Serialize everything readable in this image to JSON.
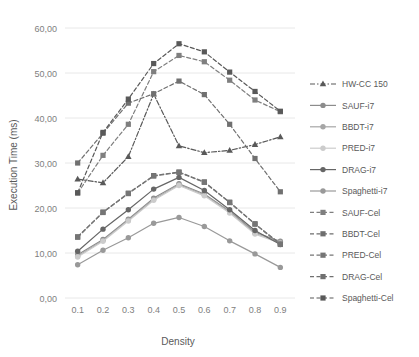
{
  "chart_data": {
    "type": "line",
    "title": "",
    "xlabel": "Density",
    "ylabel": "Execution Time (ms)",
    "x": [
      0.1,
      0.2,
      0.3,
      0.4,
      0.5,
      0.6,
      0.7,
      0.8,
      0.9
    ],
    "xtick_labels": [
      "0.1",
      "0.2",
      "0.3",
      "0.4",
      "0.5",
      "0.6",
      "0.7",
      "0.8",
      "0.9"
    ],
    "ytick_labels": [
      "0,00",
      "10,00",
      "20,00",
      "30,00",
      "40,00",
      "50,00",
      "60,00"
    ],
    "ytick_values": [
      0,
      10,
      20,
      30,
      40,
      50,
      60
    ],
    "ylim": [
      0,
      60
    ],
    "grid": "horizontal",
    "legend_position": "right",
    "series": [
      {
        "name": "HW-CC 150",
        "marker": "triangle",
        "dash": "dashdot",
        "color": "#595959",
        "values": [
          26.4,
          25.6,
          31.4,
          45.3,
          33.8,
          32.3,
          32.8,
          34.1,
          35.8
        ]
      },
      {
        "name": "SAUF-i7",
        "marker": "circle",
        "dash": "solid",
        "color": "#8c8c8c",
        "values": [
          9.6,
          13.0,
          17.5,
          22.2,
          25.4,
          23.1,
          19.3,
          14.6,
          12.6
        ]
      },
      {
        "name": "BBDT-i7",
        "marker": "circle",
        "dash": "solid",
        "color": "#a6a6a6",
        "values": [
          9.3,
          12.8,
          17.3,
          21.9,
          25.2,
          22.9,
          19.1,
          14.4,
          12.4
        ]
      },
      {
        "name": "PRED-i7",
        "marker": "circle",
        "dash": "solid",
        "color": "#cccccc",
        "values": [
          9.1,
          12.6,
          17.1,
          21.7,
          25.0,
          22.7,
          18.9,
          14.2,
          12.2
        ]
      },
      {
        "name": "DRAG-i7",
        "marker": "circle",
        "dash": "solid",
        "color": "#666666",
        "values": [
          10.4,
          15.3,
          19.6,
          24.2,
          26.8,
          23.9,
          19.6,
          15.0,
          11.9
        ]
      },
      {
        "name": "Spaghetti-i7",
        "marker": "circle",
        "dash": "solid",
        "color": "#999999",
        "values": [
          7.4,
          10.6,
          13.4,
          16.6,
          17.9,
          15.9,
          12.7,
          9.8,
          6.8
        ]
      },
      {
        "name": "SAUF-Cel",
        "marker": "square",
        "dash": "dashed",
        "color": "#7f7f7f",
        "values": [
          23.3,
          31.7,
          38.6,
          50.3,
          53.9,
          52.5,
          48.4,
          44.0,
          41.4
        ]
      },
      {
        "name": "BBDT-Cel",
        "marker": "square",
        "dash": "dashed",
        "color": "#6e6e6e",
        "values": [
          13.6,
          19.1,
          23.3,
          27.2,
          28.0,
          25.8,
          21.3,
          16.5,
          12.0
        ]
      },
      {
        "name": "PRED-Cel",
        "marker": "square",
        "dash": "dashed",
        "color": "#757575",
        "values": [
          13.5,
          19.0,
          23.2,
          27.1,
          27.9,
          25.7,
          21.2,
          16.4,
          11.9
        ]
      },
      {
        "name": "DRAG-Cel",
        "marker": "square",
        "dash": "dashed",
        "color": "#707070",
        "values": [
          30.0,
          36.6,
          43.3,
          45.4,
          48.2,
          45.2,
          38.6,
          31.0,
          23.6
        ]
      },
      {
        "name": "Spaghetti-Cel",
        "marker": "square",
        "dash": "dashed",
        "color": "#595959",
        "values": [
          23.4,
          36.8,
          44.2,
          52.1,
          56.5,
          54.7,
          50.2,
          45.9,
          41.5
        ]
      }
    ]
  },
  "legend": {
    "items": [
      "HW-CC 150",
      "SAUF-i7",
      "BBDT-i7",
      "PRED-i7",
      "DRAG-i7",
      "Spaghetti-i7",
      "SAUF-Cel",
      "BBDT-Cel",
      "PRED-Cel",
      "DRAG-Cel",
      "Spaghetti-Cel"
    ]
  }
}
